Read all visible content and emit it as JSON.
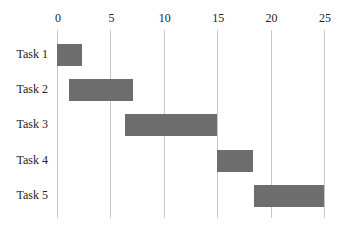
{
  "chart_data": {
    "type": "bar",
    "orientation": "horizontal-gantt",
    "title": "",
    "xlabel": "",
    "ylabel": "",
    "xlim": [
      0,
      25
    ],
    "x_ticks": [
      0,
      5,
      10,
      15,
      20,
      25
    ],
    "x_axis_position": "top",
    "grid": true,
    "legend": null,
    "categories": [
      "Task 1",
      "Task 2",
      "Task 3",
      "Task 4",
      "Task 5"
    ],
    "start": [
      0,
      1.1,
      6.4,
      15,
      18.4
    ],
    "end": [
      2.3,
      7.1,
      15,
      18.4,
      25
    ],
    "duration": [
      2.3,
      6.0,
      8.6,
      3.4,
      6.6
    ],
    "bar_color": "#6d6d6d"
  }
}
